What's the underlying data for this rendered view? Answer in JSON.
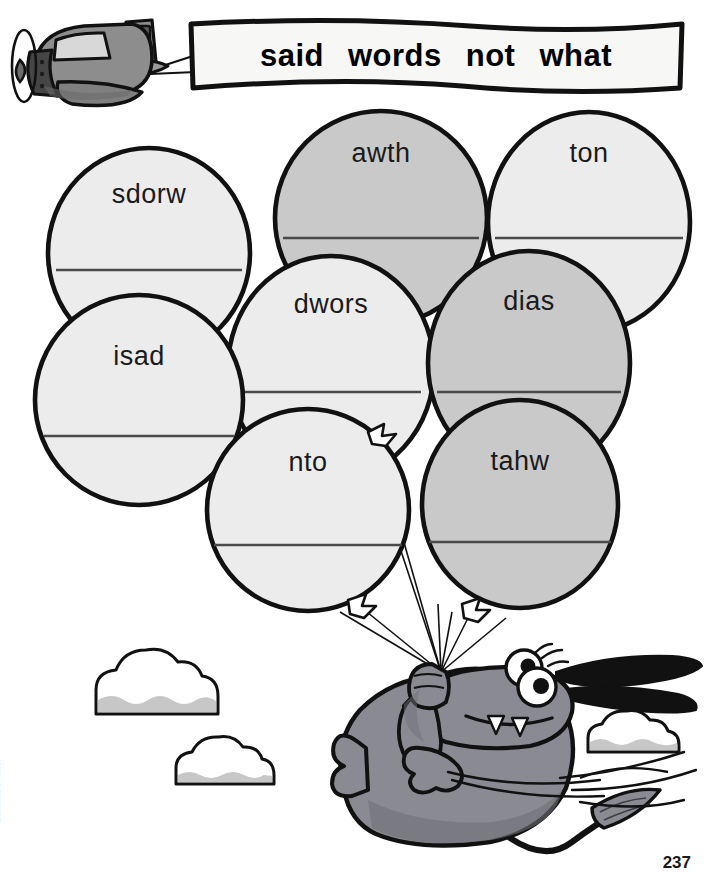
{
  "page": {
    "number": "237",
    "copyright": "© Scholastic Inc."
  },
  "banner": {
    "words": [
      "said",
      "words",
      "not",
      "what"
    ]
  },
  "balloons": [
    {
      "word": "sdorw",
      "shade": "light",
      "cx": 149,
      "cy": 253,
      "rx": 101,
      "ry": 105,
      "word_y": 203,
      "line_y": 270,
      "line_w": 186
    },
    {
      "word": "awth",
      "shade": "medium",
      "cx": 381,
      "cy": 218,
      "rx": 106,
      "ry": 107,
      "word_y": 162,
      "line_y": 238,
      "line_w": 196
    },
    {
      "word": "ton",
      "shade": "light",
      "cx": 589,
      "cy": 222,
      "rx": 101,
      "ry": 110,
      "word_y": 162,
      "line_y": 238,
      "line_w": 188
    },
    {
      "word": "dwors",
      "shade": "light",
      "cx": 331,
      "cy": 368,
      "rx": 103,
      "ry": 112,
      "word_y": 313,
      "line_y": 392,
      "line_w": 180
    },
    {
      "word": "dias",
      "shade": "medium",
      "cx": 529,
      "cy": 363,
      "rx": 101,
      "ry": 112,
      "word_y": 310,
      "line_y": 392,
      "line_w": 184
    },
    {
      "word": "isad",
      "shade": "light",
      "cx": 139,
      "cy": 400,
      "rx": 104,
      "ry": 105,
      "word_y": 365,
      "line_y": 436,
      "line_w": 190
    },
    {
      "word": "nto",
      "shade": "light",
      "cx": 308,
      "cy": 510,
      "rx": 101,
      "ry": 101,
      "word_y": 471,
      "line_y": 545,
      "line_w": 188
    },
    {
      "word": "tahw",
      "shade": "medium",
      "cx": 520,
      "cy": 504,
      "rx": 98,
      "ry": 104,
      "word_y": 470,
      "line_y": 542,
      "line_w": 182
    }
  ],
  "colors": {
    "balloon_light": "#ececec",
    "balloon_medium": "#c9c9c9",
    "outline": "#111111",
    "answer_line": "#4a4a4a",
    "plane_body": "#8d8d8d",
    "plane_dark": "#5e5e5e",
    "dog_body": "#8a8a92",
    "dog_shadow": "#6f6f78",
    "cloud_shade": "#c7c7c7",
    "page_number": "#1a1a1a",
    "copyright": "#9a9a9a"
  },
  "icons": {
    "airplane": "airplane-icon",
    "dog": "dog-character-icon",
    "cloud": "cloud-icon",
    "balloon": "balloon-icon",
    "banner": "banner-icon"
  }
}
